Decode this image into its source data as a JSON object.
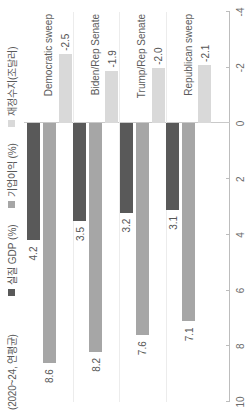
{
  "chart_data": {
    "type": "bar",
    "orientation": "horizontal",
    "title": "(2020~24, 연평균)",
    "xlabel": "",
    "ylabel": "",
    "categories": [
      "Democratic sweep",
      "Biden/Rep Senate",
      "Trump/Rep Senate",
      "Republican sweep"
    ],
    "series": [
      {
        "name": "실질 GDP (%)",
        "color": "#595959",
        "values": [
          4.2,
          3.5,
          3.2,
          3.1
        ]
      },
      {
        "name": "기업이익 (%)",
        "color": "#a6a6a6",
        "values": [
          8.6,
          8.2,
          7.6,
          7.1
        ]
      },
      {
        "name": "재정수지(조달러)",
        "color": "#d9d9d9",
        "values": [
          -2.5,
          -1.9,
          -2.0,
          -2.1
        ]
      }
    ],
    "value_labels": [
      [
        "4.2",
        "8.6",
        "-2.5"
      ],
      [
        "3.5",
        "8.2",
        "-1.9"
      ],
      [
        "3.2",
        "7.6",
        "-2.0"
      ],
      [
        "3.1",
        "7.1",
        "-2.1"
      ]
    ],
    "axis_ticks": [
      "10",
      "8",
      "6",
      "4",
      "2",
      "0",
      "-2",
      "-4"
    ],
    "axis_tick_values": [
      10,
      8,
      6,
      4,
      2,
      0,
      -2,
      -4
    ],
    "ylim": [
      -4,
      10
    ],
    "grid": false,
    "legend_position": "top"
  }
}
